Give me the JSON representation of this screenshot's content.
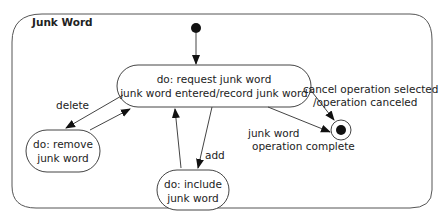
{
  "diagram": {
    "type": "uml-state-machine",
    "composite_state": {
      "name": "Junk Word"
    },
    "states": [
      {
        "id": "request",
        "line1": "do: request junk word",
        "line2": "junk word entered/record junk word"
      },
      {
        "id": "remove",
        "line1": "do: remove",
        "line2": "junk word"
      },
      {
        "id": "include",
        "line1": "do: include",
        "line2": "junk word"
      }
    ],
    "pseudostates": [
      {
        "id": "initial",
        "kind": "initial"
      },
      {
        "id": "final",
        "kind": "final"
      }
    ],
    "transitions": [
      {
        "from": "initial",
        "to": "request",
        "label": ""
      },
      {
        "from": "request",
        "to": "remove",
        "label": "delete"
      },
      {
        "from": "remove",
        "to": "request",
        "label": ""
      },
      {
        "from": "request",
        "to": "include",
        "label": "add"
      },
      {
        "from": "include",
        "to": "request",
        "label": ""
      },
      {
        "from": "request",
        "to": "final",
        "label_line1": "cancel operation selected",
        "label_line2": "/operation canceled"
      },
      {
        "from": "request",
        "to": "final",
        "label_line1": "junk word",
        "label_line2": "operation complete"
      }
    ],
    "colors": {
      "line": "#444444",
      "fill": "#ffffff",
      "text": "#222222"
    }
  }
}
